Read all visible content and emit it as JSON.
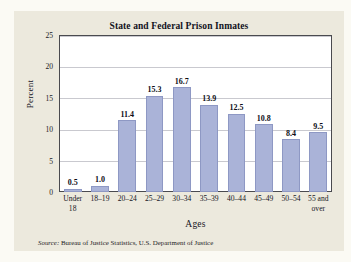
{
  "figure": {
    "title": "State and Federal Prison Inmates",
    "source_label": "Source:",
    "source_text": " Bureau of Justice Statistics, U.S. Department of Justice"
  },
  "axes": {
    "x_title": "Ages",
    "y_title": "Percent",
    "y_ticks": [
      "0",
      "5",
      "10",
      "15",
      "20",
      "25"
    ]
  },
  "colors": {
    "bar_fill": "#aab3d8",
    "bar_border": "#8e98c4",
    "panel_bg": "#ece9dd",
    "plot_bg": "#ffffff",
    "frame": "#4a4a4f",
    "gridline": "#c9c9cf"
  },
  "chart_data": {
    "type": "bar",
    "title": "State and Federal Prison Inmates",
    "xlabel": "Ages",
    "ylabel": "Percent",
    "ylim": [
      0,
      25
    ],
    "yticks": [
      0,
      5,
      10,
      15,
      20,
      25
    ],
    "grid": true,
    "legend": null,
    "categories": [
      "Under 18",
      "18–19",
      "20–24",
      "25–29",
      "30–34",
      "35–39",
      "40–44",
      "45–49",
      "50–54",
      "55 and over"
    ],
    "values": [
      0.5,
      1.0,
      11.4,
      15.3,
      16.7,
      13.9,
      12.5,
      10.8,
      8.4,
      9.5
    ],
    "data_labels": [
      "0.5",
      "1.0",
      "11.4",
      "15.3",
      "16.7",
      "13.9",
      "12.5",
      "10.8",
      "8.4",
      "9.5"
    ],
    "annotations": [
      "Source: Bureau of Justice Statistics, U.S. Department of Justice"
    ]
  }
}
